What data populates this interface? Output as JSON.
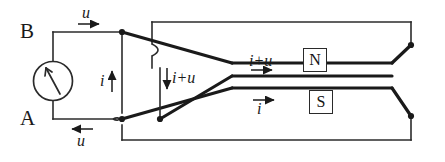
{
  "figure": {
    "type": "circuit-diagram",
    "stroke_color": "#2b2b2b",
    "conductor_color": "#1a1a1a",
    "background": "#ffffff"
  },
  "terminals": {
    "top": "B",
    "bottom": "A"
  },
  "source": {
    "symbol": "meter-arrow",
    "shape": "circle"
  },
  "annotations": {
    "top_voltage": "u",
    "bottom_voltage": "u",
    "source_current": "i",
    "branch_current": "i+u",
    "upper_line_current": "i+u",
    "lower_line_current": "i"
  },
  "poles": {
    "north": "N",
    "south": "S"
  },
  "arrows": {
    "top_u_direction": "right",
    "bottom_u_direction": "left",
    "source_i_direction": "up",
    "branch_iu_direction": "down",
    "upper_line_direction": "right",
    "lower_line_direction": "right"
  }
}
